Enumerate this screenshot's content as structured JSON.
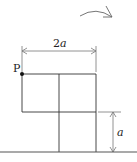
{
  "diagram": {
    "point_label": "P",
    "width_label_num": "2",
    "width_label_var": "a",
    "height_label": "a",
    "colors": {
      "line": "#333333",
      "ground": "#555555",
      "dimension": "#777777",
      "arrow": "#666666",
      "point": "#111111"
    }
  }
}
